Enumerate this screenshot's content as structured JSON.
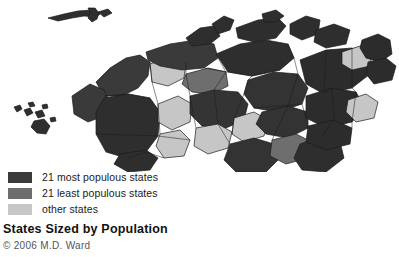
{
  "figure": {
    "title": "States Sized by Population",
    "credit": "© 2006 M.D. Ward"
  },
  "legend": {
    "items": [
      {
        "label": "21 most populous states",
        "color": "#3a3a3a",
        "swatch_name": "legend-swatch-most-populous"
      },
      {
        "label": "21 least populous states",
        "color": "#6e6e6e",
        "swatch_name": "legend-swatch-least-populous"
      },
      {
        "label": "other states",
        "color": "#c6c6c6",
        "swatch_name": "legend-swatch-other"
      }
    ]
  },
  "map": {
    "type": "cartogram",
    "subject": "United States states scaled by population",
    "background": "#ffffff",
    "stroke": "#1b1b1b",
    "classes": {
      "most_populous": "#3a3a3a",
      "least_populous": "#6e6e6e",
      "other": "#c6c6c6"
    },
    "regions": [
      {
        "name": "alaska-aleutians",
        "class": "most_populous"
      },
      {
        "name": "hawaii-islands",
        "class": "most_populous"
      },
      {
        "name": "pacific-northwest-block",
        "class": "most_populous"
      },
      {
        "name": "california-block",
        "class": "most_populous"
      },
      {
        "name": "mountain-west-block",
        "class": "other"
      },
      {
        "name": "great-plains-block",
        "class": "least_populous"
      },
      {
        "name": "texas-block",
        "class": "most_populous"
      },
      {
        "name": "midwest-block",
        "class": "most_populous"
      },
      {
        "name": "great-lakes-block",
        "class": "most_populous"
      },
      {
        "name": "deep-south-block",
        "class": "least_populous"
      },
      {
        "name": "florida-block",
        "class": "most_populous"
      },
      {
        "name": "mid-atlantic-block",
        "class": "most_populous"
      },
      {
        "name": "new-england-block",
        "class": "other"
      },
      {
        "name": "northeast-corridor-block",
        "class": "most_populous"
      }
    ]
  }
}
